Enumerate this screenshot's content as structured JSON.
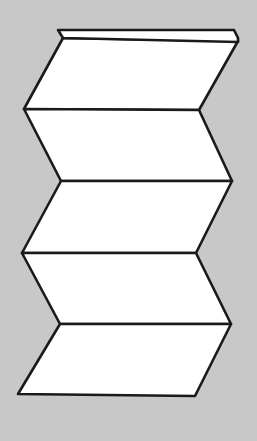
{
  "diagram": {
    "kind": "zigzag-fold-illustration",
    "colors": {
      "background": "#c8c8c8",
      "panel_fill": "#ffffff",
      "stroke": "#1a1a1a"
    },
    "stroke_width": 2.6,
    "top_strip": {
      "points": [
        [
          58,
          30
        ],
        [
          234,
          30
        ],
        [
          238,
          38
        ],
        [
          238,
          42
        ],
        [
          63,
          38
        ]
      ]
    },
    "fold_lines": [
      {
        "left": [
          63,
          38
        ],
        "right": [
          238,
          41
        ]
      },
      {
        "left": [
          24,
          109
        ],
        "right": [
          199,
          110
        ]
      },
      {
        "left": [
          61,
          181
        ],
        "right": [
          232,
          181
        ]
      },
      {
        "left": [
          22,
          253
        ],
        "right": [
          196,
          253
        ]
      },
      {
        "left": [
          60,
          324
        ],
        "right": [
          231,
          324
        ]
      },
      {
        "left": [
          18,
          394
        ],
        "right": [
          195,
          396
        ]
      }
    ],
    "panel_count": 5
  }
}
